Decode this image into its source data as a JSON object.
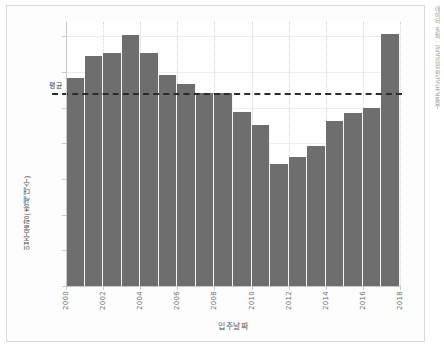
{
  "chart_data": {
    "type": "bar",
    "title": "",
    "subtitle": "",
    "xlabel": "입주날짜",
    "ylabel": "입주물량(총세대수)",
    "categories": [
      "2000",
      "2001",
      "2002",
      "2003",
      "2004",
      "2005",
      "2006",
      "2007",
      "2008",
      "2009",
      "2010",
      "2011",
      "2012",
      "2013",
      "2014",
      "2015",
      "2016",
      "2017"
    ],
    "values": [
      292000,
      323000,
      327000,
      352000,
      326000,
      296000,
      283000,
      270000,
      270000,
      244000,
      226000,
      171000,
      181000,
      196000,
      231000,
      242000,
      250000,
      353000
    ],
    "xlim": [
      2000,
      2018
    ],
    "ylim": [
      0,
      370000
    ],
    "ytick_values": [
      0,
      50000,
      100000,
      150000,
      200000,
      250000,
      300000,
      350000
    ],
    "ytick_labels": [
      "0K",
      "50K",
      "100K",
      "150K",
      "200K",
      "250K",
      "300K",
      "350K"
    ],
    "xtick_values": [
      2000,
      2002,
      2004,
      2006,
      2008,
      2010,
      2012,
      2014,
      2016,
      2018
    ],
    "xtick_labels": [
      "2000",
      "2002",
      "2004",
      "2006",
      "2008",
      "2010",
      "2012",
      "2014",
      "2016",
      "2018"
    ],
    "grid": "horizontal-and-vertical",
    "legend_position": "none",
    "bar_color": "#6e6e6e",
    "annotations": [
      {
        "name": "average-line",
        "label": "평균",
        "value": 270000,
        "style": "dashed",
        "color": "#2b2b2b"
      }
    ]
  },
  "axes": {
    "y_title": "입주물량(총세대수)",
    "x_title": "입주날짜"
  },
  "caption": {
    "source_text": "데이터 출처 : 한국감정원/국토교통부"
  },
  "colors": {
    "bar": "#6e6e6e",
    "average_line": "#2b2b2b",
    "grid": "#eceded",
    "axis": "#c9c9c9",
    "tick_text": "#707070",
    "title_text": "#555555",
    "plot_background": "#ffffff",
    "figure_background": "#fdfdfd"
  }
}
